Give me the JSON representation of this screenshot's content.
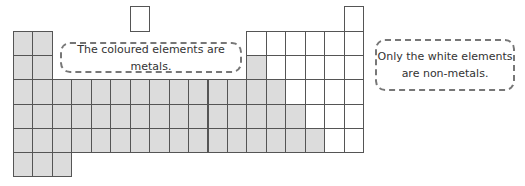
{
  "diagram": {
    "colors": {
      "metal": "#dcdcdc",
      "nonmetal": "#ffffff",
      "border": "#555555"
    },
    "grid": {
      "left": 13,
      "top": 6,
      "cell_w": 19.45,
      "cell_h": 24.2,
      "columns": 18
    },
    "rows": [
      {
        "row": 1,
        "cells": [
          {
            "col": 7,
            "type": "nonmetal"
          },
          {
            "col": 18,
            "type": "nonmetal"
          }
        ]
      },
      {
        "row": 2,
        "metal_cols": [
          1,
          2
        ],
        "nonmetal_cols": [
          13,
          14,
          15,
          16,
          17,
          18
        ]
      },
      {
        "row": 3,
        "metal_cols": [
          1,
          2,
          13
        ],
        "nonmetal_cols": [
          14,
          15,
          16,
          17,
          18
        ]
      },
      {
        "row": 4,
        "metal_cols": [
          1,
          2,
          3,
          4,
          5,
          6,
          7,
          8,
          9,
          10,
          11,
          12,
          13,
          14
        ],
        "nonmetal_cols": [
          15,
          16,
          17,
          18
        ]
      },
      {
        "row": 5,
        "metal_cols": [
          1,
          2,
          3,
          4,
          5,
          6,
          7,
          8,
          9,
          10,
          11,
          12,
          13,
          14,
          15
        ],
        "nonmetal_cols": [
          16,
          17,
          18
        ]
      },
      {
        "row": 6,
        "metal_cols": [
          1,
          2,
          3,
          4,
          5,
          6,
          7,
          8,
          9,
          10,
          11,
          12,
          13,
          14,
          15,
          16
        ],
        "nonmetal_cols": [
          17,
          18
        ]
      },
      {
        "row": 7,
        "metal_cols": [
          1,
          2,
          3
        ],
        "nonmetal_cols": []
      }
    ],
    "callouts": [
      {
        "id": "metals-note",
        "lines": [
          "The coloured elements are metals."
        ],
        "x": 60,
        "y": 42,
        "w": 182,
        "h": 31
      },
      {
        "id": "nonmetals-note",
        "lines": [
          "Only the white elements",
          "are non-metals."
        ],
        "x": 375,
        "y": 39,
        "w": 140,
        "h": 52
      }
    ]
  }
}
